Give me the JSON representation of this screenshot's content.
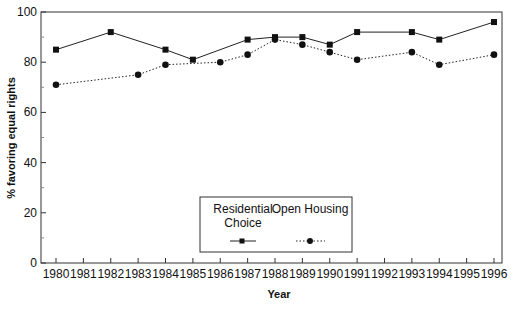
{
  "chart_data": {
    "type": "line",
    "title": "",
    "xlabel": "Year",
    "ylabel": "% favoring equal rights",
    "ylim": [
      0,
      100
    ],
    "yticks": [
      0,
      20,
      40,
      60,
      80,
      100
    ],
    "yminor_ticks": [
      10,
      30,
      50,
      70,
      90
    ],
    "xticks": [
      1980,
      1981,
      1982,
      1983,
      1984,
      1985,
      1986,
      1987,
      1988,
      1989,
      1990,
      1991,
      1992,
      1993,
      1994,
      1995,
      1996
    ],
    "grid": false,
    "legend_position": "lower center inside",
    "series": [
      {
        "name": "Residential Choice",
        "marker": "square",
        "line_style": "solid",
        "points": [
          {
            "x": 1980,
            "y": 85
          },
          {
            "x": 1982,
            "y": 92
          },
          {
            "x": 1984,
            "y": 85
          },
          {
            "x": 1985,
            "y": 81
          },
          {
            "x": 1987,
            "y": 89
          },
          {
            "x": 1988,
            "y": 90
          },
          {
            "x": 1989,
            "y": 90
          },
          {
            "x": 1990,
            "y": 87
          },
          {
            "x": 1991,
            "y": 92
          },
          {
            "x": 1993,
            "y": 92
          },
          {
            "x": 1994,
            "y": 89
          },
          {
            "x": 1996,
            "y": 96
          }
        ]
      },
      {
        "name": "Open Housing",
        "marker": "circle",
        "line_style": "dotted",
        "points": [
          {
            "x": 1980,
            "y": 71
          },
          {
            "x": 1983,
            "y": 75
          },
          {
            "x": 1984,
            "y": 79
          },
          {
            "x": 1986,
            "y": 80
          },
          {
            "x": 1987,
            "y": 83
          },
          {
            "x": 1988,
            "y": 89
          },
          {
            "x": 1989,
            "y": 87
          },
          {
            "x": 1990,
            "y": 84
          },
          {
            "x": 1991,
            "y": 81
          },
          {
            "x": 1993,
            "y": 84
          },
          {
            "x": 1994,
            "y": 79
          },
          {
            "x": 1996,
            "y": 83
          }
        ]
      }
    ]
  },
  "legend": {
    "residential_line1": "Residential",
    "residential_line2": "Choice",
    "open_housing": "Open Housing"
  },
  "colors": {
    "line": "#222222",
    "axis": "#333333",
    "background": "#ffffff"
  }
}
